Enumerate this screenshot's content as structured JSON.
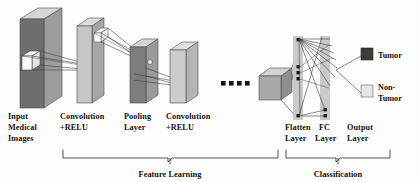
{
  "figure": {
    "type": "cnn-architecture-diagram",
    "title": "",
    "background_color": "#fdfdfd"
  },
  "stages": [
    {
      "id": "input",
      "label_lines": [
        "Input",
        "Medical",
        "Images"
      ],
      "x": 8,
      "y": 118
    },
    {
      "id": "conv1",
      "label_lines": [
        "Convolution",
        "+RELU"
      ],
      "x": 60,
      "y": 118
    },
    {
      "id": "pool",
      "label_lines": [
        "Pooling",
        "Layer"
      ],
      "x": 125,
      "y": 118
    },
    {
      "id": "conv2",
      "label_lines": [
        "Convolution",
        "+RELU"
      ],
      "x": 168,
      "y": 118
    },
    {
      "id": "flatten",
      "label_lines": [
        "Flatten",
        "Layer"
      ],
      "x": 288,
      "y": 125
    },
    {
      "id": "fc",
      "label_lines": [
        "FC",
        "Layer"
      ],
      "x": 321,
      "y": 125
    },
    {
      "id": "output",
      "label_lines": [
        "Output",
        "Layer"
      ],
      "x": 351,
      "y": 125
    }
  ],
  "sections": [
    {
      "id": "feature-learning",
      "label": "Feature Learning",
      "x1": 63,
      "x2": 278,
      "label_x": 170,
      "label_y": 177
    },
    {
      "id": "classification",
      "label": "Classification",
      "x1": 286,
      "x2": 390,
      "label_x": 338,
      "label_y": 177
    }
  ],
  "legend": {
    "items": [
      {
        "id": "tumor",
        "label_lines": [
          "Tumor"
        ],
        "color": "#3a3a3a",
        "swatch_x": 361,
        "swatch_y": 52
      },
      {
        "id": "non-tumor",
        "label_lines": [
          "Non-",
          "Tumor"
        ],
        "color": "#e2e2e2",
        "swatch_x": 361,
        "swatch_y": 88
      }
    ]
  },
  "ellipsis": {
    "id": "ellipsis-dots",
    "count": 4,
    "color": "#111111",
    "y": 84,
    "x_start": 222,
    "spacing": 8
  },
  "colors": {
    "slab_face_dark": "#6e6e6e",
    "slab_face_mid": "#8d8d8d",
    "slab_face_light": "#cfcfcf",
    "slab_top": "#d8d8d8",
    "slab_side": "#a8a8a8",
    "line": "#3b3b3b",
    "node": "#111111",
    "strip": "#c9c9c9",
    "patch": "#f4f4f4"
  }
}
